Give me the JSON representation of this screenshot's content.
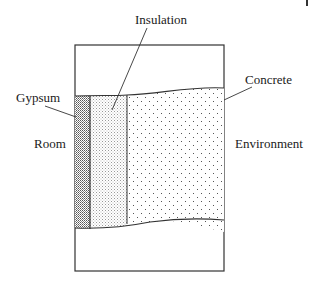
{
  "diagram": {
    "type": "composite-wall-cross-section",
    "labels": {
      "insulation": "Insulation",
      "concrete": "Concrete",
      "gypsum": "Gypsum",
      "room": "Room",
      "environment": "Environment"
    },
    "layers": [
      {
        "name": "Gypsum",
        "pattern": "dense-dots"
      },
      {
        "name": "Insulation",
        "pattern": "fine-dots"
      },
      {
        "name": "Concrete",
        "pattern": "sparse-dots"
      }
    ],
    "colors": {
      "stroke": "#333333",
      "text": "#1a1a1a",
      "background": "#ffffff"
    }
  }
}
